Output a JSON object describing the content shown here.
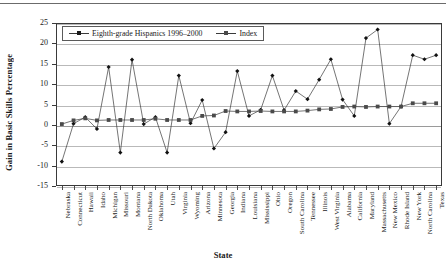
{
  "figure": {
    "ylabel": "Gain in Basic Skills Percentage",
    "xlabel": "State"
  },
  "legend": {
    "position": "top-left-inside",
    "entries": [
      {
        "label": "Eighth-grade Hispanics 1996–2000",
        "marker": "diamond"
      },
      {
        "label": "Index",
        "marker": "square"
      }
    ]
  },
  "axis": {
    "y_ticks": [
      "25",
      "20",
      "15",
      "10",
      "5",
      "0",
      "-5",
      "-10",
      "-15"
    ]
  },
  "chart_data": {
    "type": "line",
    "title": "",
    "xlabel": "State",
    "ylabel": "Gain in Basic Skills Percentage",
    "ylim": [
      -15,
      25
    ],
    "ytick_step": 5,
    "grid": true,
    "legend_position": "upper left",
    "categories": [
      "Nebraska",
      "Connecticut",
      "Hawaii",
      "Idaho",
      "Michigan",
      "Missouri",
      "Montana",
      "North Dakota",
      "Oklahoma",
      "Utah",
      "Virginia",
      "Wyoming",
      "Arizona",
      "Minnesota",
      "Georgia",
      "Indiana",
      "Louisiana",
      "Mississippi",
      "Ohio",
      "Oregon",
      "South Carolina",
      "Tennessee",
      "Illinois",
      "West Virginia",
      "Alabama",
      "California",
      "Maryland",
      "Massachusetts",
      "New Mexico",
      "Rhode Island",
      "New York",
      "North Carolina",
      "Texas"
    ],
    "series": [
      {
        "name": "Eighth-grade Hispanics 1996–2000",
        "marker": "diamond",
        "values": [
          -9.0,
          0.3,
          1.9,
          -1.0,
          14.2,
          -6.8,
          16.0,
          0.2,
          1.9,
          -6.8,
          12.1,
          0.4,
          6.1,
          -5.8,
          -1.8,
          13.2,
          2.2,
          3.7,
          12.1,
          3.6,
          8.3,
          6.3,
          11.1,
          16.1,
          6.2,
          2.2,
          21.3,
          23.4,
          0.3,
          4.5,
          17.1,
          16.1,
          17.1
        ]
      },
      {
        "name": "Index",
        "marker": "square",
        "values": [
          0.2,
          1.1,
          1.6,
          1.1,
          1.2,
          1.2,
          1.2,
          1.2,
          1.5,
          1.2,
          1.2,
          1.2,
          2.2,
          2.3,
          3.4,
          3.3,
          3.3,
          3.4,
          3.3,
          3.3,
          3.3,
          3.5,
          3.8,
          3.9,
          4.4,
          4.5,
          4.4,
          4.5,
          4.5,
          4.5,
          5.3,
          5.3,
          5.3
        ]
      }
    ]
  }
}
